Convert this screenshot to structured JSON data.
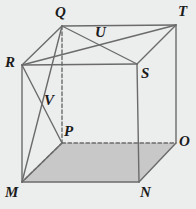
{
  "figure": {
    "background_color": "#eceded",
    "stroke_color": "#6b6b6b",
    "label_color": "#1b1b1b",
    "base_shade_color": "#c8c8c8",
    "width": 196,
    "height": 209
  },
  "vertices": [
    {
      "id": "Q",
      "label": "Q",
      "x": 62,
      "y": 26,
      "label_x": 55,
      "label_y": 5,
      "hidden": false
    },
    {
      "id": "T",
      "label": "T",
      "x": 176,
      "y": 25,
      "label_x": 178,
      "label_y": 4,
      "hidden": false
    },
    {
      "id": "R",
      "label": "R",
      "x": 22,
      "y": 65,
      "label_x": 5,
      "label_y": 55,
      "hidden": false
    },
    {
      "id": "S",
      "label": "S",
      "x": 137,
      "y": 64,
      "label_x": 141,
      "label_y": 66,
      "hidden": false
    },
    {
      "id": "U",
      "label": "U",
      "x": 98,
      "y": 44,
      "label_x": 95,
      "label_y": 25,
      "hidden": false
    },
    {
      "id": "V",
      "label": "V",
      "x": 48,
      "y": 100,
      "label_x": 44,
      "label_y": 93,
      "hidden": false
    },
    {
      "id": "P",
      "label": "P",
      "x": 62,
      "y": 143,
      "label_x": 64,
      "label_y": 124,
      "hidden": true
    },
    {
      "id": "O",
      "label": "O",
      "x": 176,
      "y": 143,
      "label_x": 179,
      "label_y": 134,
      "hidden": false
    },
    {
      "id": "M",
      "label": "M",
      "x": 22,
      "y": 182,
      "label_x": 5,
      "label_y": 185,
      "hidden": false
    },
    {
      "id": "N",
      "label": "N",
      "x": 139,
      "y": 182,
      "label_x": 140,
      "label_y": 185,
      "hidden": false
    }
  ],
  "edges": [
    {
      "name": "edge-R-S",
      "from": "R",
      "to": "S",
      "style": "solid"
    },
    {
      "name": "edge-S-N",
      "from": "S",
      "to": "N",
      "style": "solid"
    },
    {
      "name": "edge-N-M",
      "from": "N",
      "to": "M",
      "style": "solid"
    },
    {
      "name": "edge-M-R",
      "from": "M",
      "to": "R",
      "style": "solid"
    },
    {
      "name": "edge-Q-T",
      "from": "Q",
      "to": "T",
      "style": "solid"
    },
    {
      "name": "edge-T-O",
      "from": "T",
      "to": "O",
      "style": "solid"
    },
    {
      "name": "edge-O-N",
      "from": "O",
      "to": "N",
      "style": "solid"
    },
    {
      "name": "edge-R-Q",
      "from": "R",
      "to": "Q",
      "style": "solid"
    },
    {
      "name": "edge-S-T",
      "from": "S",
      "to": "T",
      "style": "solid"
    },
    {
      "name": "edge-Q-P",
      "from": "Q",
      "to": "P",
      "style": "dashed"
    },
    {
      "name": "edge-P-M",
      "from": "P",
      "to": "M",
      "style": "dashed"
    },
    {
      "name": "edge-P-O",
      "from": "P",
      "to": "O",
      "style": "dashed"
    }
  ],
  "diagonals": [
    {
      "name": "diagonal-Q-S",
      "from": "Q",
      "to": "S",
      "style": "solid"
    },
    {
      "name": "diagonal-R-T",
      "from": "R",
      "to": "T",
      "style": "solid"
    },
    {
      "name": "diagonal-Q-M",
      "from": "Q",
      "to": "M",
      "style": "solid"
    },
    {
      "name": "diagonal-R-P",
      "from": "R",
      "to": "P",
      "style": "solid"
    },
    {
      "name": "diagonal-M-P",
      "from": "M",
      "to": "P",
      "style": "solid"
    }
  ],
  "shaded_faces": [
    {
      "name": "base-face-MNOP",
      "path": "M",
      "points": "22,182 139,182 176,143 62,143"
    }
  ]
}
